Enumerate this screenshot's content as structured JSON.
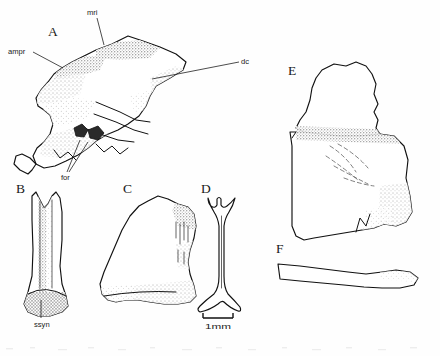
{
  "figure": {
    "type": "scientific-illustration-plate",
    "medium": "line drawing with stipple shading",
    "background_color": "#fefefe",
    "ink_color": "#111111",
    "width": 440,
    "height": 356
  },
  "panels": [
    {
      "id": "A",
      "letter": "A",
      "letter_x": 48,
      "letter_y": 36,
      "description": "large bone element in lateral view with stippled shading"
    },
    {
      "id": "B",
      "letter": "B",
      "letter_x": 16,
      "letter_y": 193,
      "description": "elongate forked element with cross-hatched base"
    },
    {
      "id": "C",
      "letter": "C",
      "letter_x": 123,
      "letter_y": 193,
      "description": "irregular plate-like bone fragment"
    },
    {
      "id": "D",
      "letter": "D",
      "letter_x": 201,
      "letter_y": 193,
      "description": "slender forked strut element"
    },
    {
      "id": "E",
      "letter": "E",
      "letter_x": 288,
      "letter_y": 75,
      "description": "large blocky bone fragment with dashed internal contours"
    },
    {
      "id": "F",
      "letter": "F",
      "letter_x": 276,
      "letter_y": 253,
      "description": "slender elongate rib-like element"
    }
  ],
  "anatomical_labels": [
    {
      "id": "mri",
      "text": "mri",
      "text_x": 87,
      "text_y": 15,
      "leader": "M 97 18 L 104 45"
    },
    {
      "id": "ampr",
      "text": "ampr",
      "text_x": 8,
      "text_y": 54,
      "leader": "M 33 52 L 63 68"
    },
    {
      "id": "dc",
      "text": "dc",
      "text_x": 241,
      "text_y": 64,
      "leader": "M 239 62 L 152 79"
    },
    {
      "id": "for",
      "text": "for",
      "text_x": 61,
      "text_y": 180,
      "leader_1": "M 67 172 L 80 140",
      "leader_2": "M 69 172 L 88 142"
    },
    {
      "id": "ssyn",
      "text": "ssyn",
      "text_x": 34,
      "text_y": 327,
      "leader": "M 41 318 L 41 300"
    }
  ],
  "scale_bar": {
    "label": "1mm",
    "label_x": 205,
    "label_y": 329,
    "bar_x1": 203,
    "bar_x2": 233,
    "bar_y": 318,
    "tick_height": 5
  }
}
